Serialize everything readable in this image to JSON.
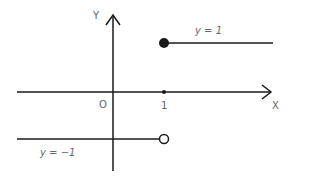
{
  "diagram": {
    "type": "step-function-graph",
    "axes": {
      "x_label": "X",
      "y_label": "Y",
      "origin_label": "O",
      "x_tick_label": "1"
    },
    "segments": [
      {
        "label": "y = 1",
        "y": 1,
        "from_x": 1,
        "to_x": "+inf",
        "start_point": "closed"
      },
      {
        "label": "y = −1",
        "y": -1,
        "from_x": "-inf",
        "to_x": 1,
        "end_point": "open"
      }
    ],
    "colors": {
      "lines": "#1a1a1a",
      "labels": "#666666"
    }
  }
}
